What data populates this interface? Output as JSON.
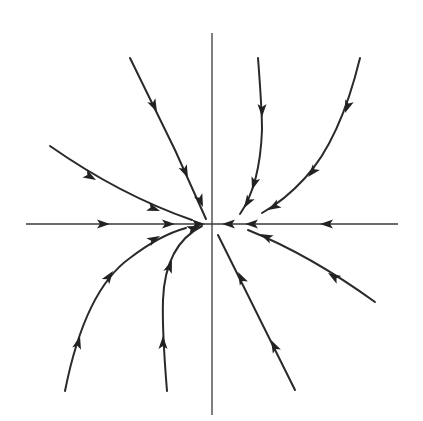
{
  "figure": {
    "colors": {
      "background": "#ffffff",
      "axis": "#3a3a3a",
      "trajectory": "#2a2a2a",
      "arrowhead": "#222222"
    },
    "origin": [
      212,
      224
    ],
    "axes": {
      "horizontal": {
        "from": [
          26,
          224
        ],
        "to": [
          398,
          224
        ]
      },
      "vertical": {
        "from": [
          212,
          33
        ],
        "to": [
          212,
          415
        ]
      }
    },
    "trajectories": [
      {
        "id": "upper-left-steep",
        "path": "M130,58 L175,150 L206,219"
      },
      {
        "id": "upper-center-right",
        "path": "M258,58 Q262,110 262,130 Q260,185 240,214"
      },
      {
        "id": "upper-right",
        "path": "M360,58 Q340,140 305,178 Q285,200 262,213"
      },
      {
        "id": "left-shallow",
        "path": "M50,146 Q120,195 192,220"
      },
      {
        "id": "lower-right-shallow",
        "path": "M375,302 Q310,255 248,230"
      },
      {
        "id": "lower-right-steep",
        "path": "M295,390 L218,235"
      },
      {
        "id": "lower-left",
        "path": "M65,391 Q85,290 130,258 Q160,235 186,228"
      },
      {
        "id": "lower-center-left",
        "path": "M167,391 Q162,330 163,300 Q165,245 202,226"
      }
    ],
    "arrowheads": [
      {
        "at": [
          157,
          112
        ],
        "angle": 64
      },
      {
        "at": [
          188,
          178
        ],
        "angle": 66
      },
      {
        "at": [
          203,
          207
        ],
        "angle": 68
      },
      {
        "at": [
          262,
          117
        ],
        "angle": 90
      },
      {
        "at": [
          252,
          190
        ],
        "angle": 107
      },
      {
        "at": [
          244,
          208
        ],
        "angle": 122
      },
      {
        "at": [
          345,
          113
        ],
        "angle": 110
      },
      {
        "at": [
          308,
          177
        ],
        "angle": 130
      },
      {
        "at": [
          268,
          210
        ],
        "angle": 150
      },
      {
        "at": [
          96,
          180
        ],
        "angle": 30
      },
      {
        "at": [
          160,
          211
        ],
        "angle": 20
      },
      {
        "at": [
          110,
          224
        ],
        "angle": 0
      },
      {
        "at": [
          175,
          224
        ],
        "angle": 0
      },
      {
        "at": [
          205,
          224
        ],
        "angle": 0
      },
      {
        "at": [
          222,
          224
        ],
        "angle": 180
      },
      {
        "at": [
          245,
          224
        ],
        "angle": 180
      },
      {
        "at": [
          320,
          224
        ],
        "angle": 180
      },
      {
        "at": [
          328,
          273
        ],
        "angle": 212
      },
      {
        "at": [
          260,
          234
        ],
        "angle": 205
      },
      {
        "at": [
          271,
          340
        ],
        "angle": 243
      },
      {
        "at": [
          238,
          272
        ],
        "angle": 243
      },
      {
        "at": [
          80,
          336
        ],
        "angle": -75
      },
      {
        "at": [
          113,
          271
        ],
        "angle": -55
      },
      {
        "at": [
          160,
          236
        ],
        "angle": -28
      },
      {
        "at": [
          163,
          336
        ],
        "angle": -90
      },
      {
        "at": [
          172,
          260
        ],
        "angle": -70
      },
      {
        "at": [
          200,
          226
        ],
        "angle": -20
      }
    ]
  }
}
